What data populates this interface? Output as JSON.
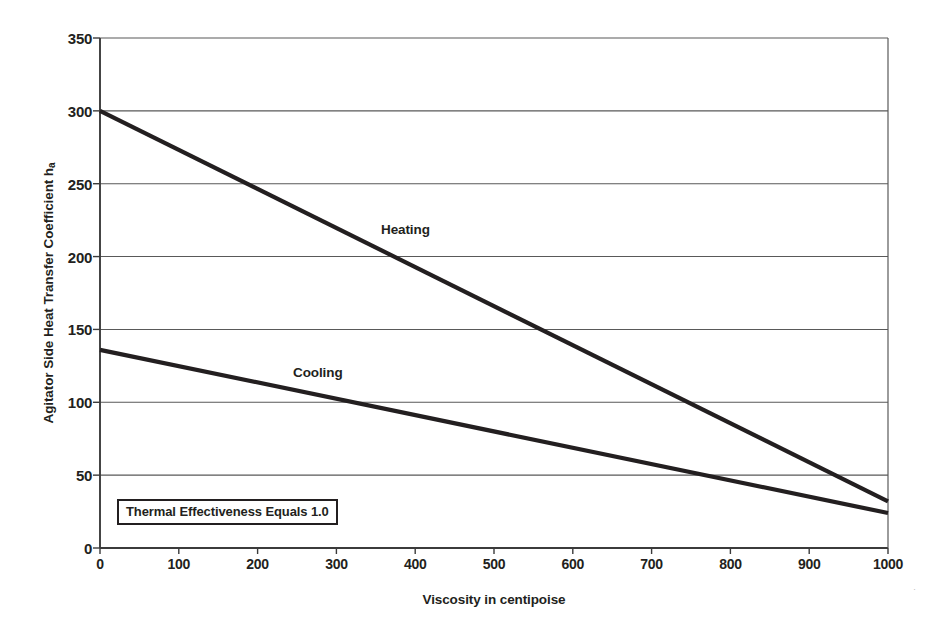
{
  "chart_data": {
    "type": "line",
    "title": "",
    "subtitle": "",
    "xlabel": "Viscosity in centipoise",
    "ylabel": "Agitator Side Heat Transfer Coefficient h",
    "ylabel_subscript": "a",
    "xlim": [
      0,
      1000
    ],
    "ylim": [
      0,
      350
    ],
    "xticks": [
      0,
      100,
      200,
      300,
      400,
      500,
      600,
      700,
      800,
      900,
      1000
    ],
    "yticks": [
      0,
      50,
      100,
      150,
      200,
      250,
      300,
      350
    ],
    "grid": "horizontal",
    "legend": "inline-labels",
    "x": [
      0,
      1000
    ],
    "series": [
      {
        "name": "Heating",
        "values": [
          300,
          32
        ],
        "color": "#231f20",
        "label_x": 420,
        "label_y": 228
      },
      {
        "name": "Cooling",
        "values": [
          136,
          24
        ],
        "color": "#231f20",
        "label_x": 260,
        "label_y": 115
      }
    ],
    "annotations": [
      {
        "text": "Thermal Effectiveness Equals 1.0",
        "x": 25,
        "y": 35,
        "boxed": true
      }
    ]
  },
  "axes": {
    "y_tick_labels": [
      "350",
      "300",
      "250",
      "200",
      "150",
      "100",
      "50",
      "0"
    ],
    "x_tick_labels": [
      "0",
      "100",
      "200",
      "300",
      "400",
      "500",
      "600",
      "700",
      "800",
      "900",
      "1000"
    ],
    "y_title": "Agitator Side Heat Transfer Coefficient h",
    "y_title_sub": "a",
    "x_title": "Viscosity in centipoise"
  },
  "series_labels": {
    "heating": "Heating",
    "cooling": "Cooling"
  },
  "annotation": {
    "thermal_effectiveness": "Thermal Effectiveness Equals 1.0"
  },
  "colors": {
    "line": "#231f20",
    "grid": "#595959",
    "axis": "#3b3b3b",
    "text": "#231f20",
    "background": "#ffffff"
  },
  "speck": "·"
}
